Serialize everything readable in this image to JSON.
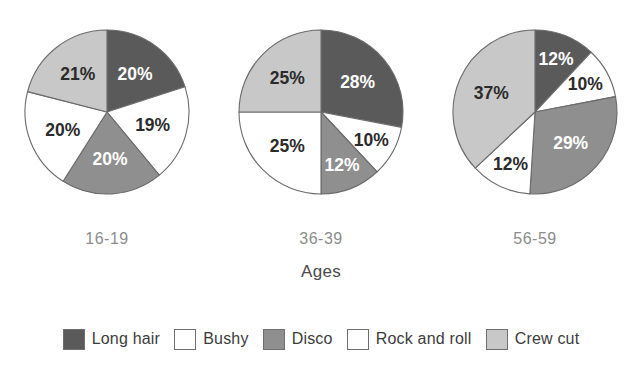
{
  "chart_data": {
    "type": "pie",
    "title": "",
    "xlabel": "Ages",
    "ylabel": "",
    "legend_position": "bottom",
    "grid": false,
    "categories": [
      "Long hair",
      "Bushy",
      "Disco",
      "Rock and roll",
      "Crew cut"
    ],
    "series": [
      {
        "name": "16-19",
        "values": [
          20,
          19,
          20,
          20,
          21
        ]
      },
      {
        "name": "36-39",
        "values": [
          28,
          10,
          12,
          25,
          25
        ]
      },
      {
        "name": "56-59",
        "values": [
          12,
          10,
          29,
          12,
          37
        ]
      }
    ],
    "colors": [
      "#5a5a5a",
      "#ffffff",
      "#8f8f8f",
      "#ffffff",
      "#c8c8c8"
    ]
  },
  "axis": {
    "title": "Ages"
  },
  "pies": [
    {
      "group_label": "16-19",
      "slices": [
        {
          "label": "Long hair",
          "value_text": "20%",
          "value": 20,
          "color": "#5a5a5a",
          "text_color": "on-dark"
        },
        {
          "label": "Bushy",
          "value_text": "19%",
          "value": 19,
          "color": "#ffffff",
          "text_color": "on-light"
        },
        {
          "label": "Disco",
          "value_text": "20%",
          "value": 20,
          "color": "#8f8f8f",
          "text_color": "on-dark"
        },
        {
          "label": "Rock and roll",
          "value_text": "20%",
          "value": 20,
          "color": "#ffffff",
          "text_color": "on-light"
        },
        {
          "label": "Crew cut",
          "value_text": "21%",
          "value": 21,
          "color": "#c8c8c8",
          "text_color": "on-light"
        }
      ]
    },
    {
      "group_label": "36-39",
      "slices": [
        {
          "label": "Long hair",
          "value_text": "28%",
          "value": 28,
          "color": "#5a5a5a",
          "text_color": "on-dark"
        },
        {
          "label": "Bushy",
          "value_text": "10%",
          "value": 10,
          "color": "#ffffff",
          "text_color": "on-light"
        },
        {
          "label": "Disco",
          "value_text": "12%",
          "value": 12,
          "color": "#8f8f8f",
          "text_color": "on-dark"
        },
        {
          "label": "Rock and roll",
          "value_text": "25%",
          "value": 25,
          "color": "#ffffff",
          "text_color": "on-light"
        },
        {
          "label": "Crew cut",
          "value_text": "25%",
          "value": 25,
          "color": "#c8c8c8",
          "text_color": "on-light"
        }
      ]
    },
    {
      "group_label": "56-59",
      "slices": [
        {
          "label": "Long hair",
          "value_text": "12%",
          "value": 12,
          "color": "#5a5a5a",
          "text_color": "on-dark"
        },
        {
          "label": "Bushy",
          "value_text": "10%",
          "value": 10,
          "color": "#ffffff",
          "text_color": "on-light"
        },
        {
          "label": "Disco",
          "value_text": "29%",
          "value": 29,
          "color": "#8f8f8f",
          "text_color": "on-dark"
        },
        {
          "label": "Rock and roll",
          "value_text": "12%",
          "value": 12,
          "color": "#ffffff",
          "text_color": "on-light"
        },
        {
          "label": "Crew cut",
          "value_text": "37%",
          "value": 37,
          "color": "#c8c8c8",
          "text_color": "on-light"
        }
      ]
    }
  ],
  "legend": {
    "items": [
      {
        "label": "Long hair",
        "color": "#5a5a5a"
      },
      {
        "label": "Bushy",
        "color": "#ffffff"
      },
      {
        "label": "Disco",
        "color": "#8f8f8f"
      },
      {
        "label": "Rock and roll",
        "color": "#ffffff"
      },
      {
        "label": "Crew cut",
        "color": "#c8c8c8"
      }
    ]
  }
}
